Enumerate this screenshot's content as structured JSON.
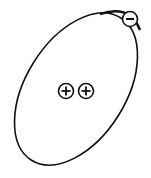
{
  "diagram": {
    "orbit": {
      "shape": "ellipse",
      "stroke": "#111111"
    },
    "nucleus": {
      "particles": [
        {
          "type": "proton",
          "symbol": "+"
        },
        {
          "type": "proton",
          "symbol": "+"
        }
      ]
    },
    "electrons": [
      {
        "type": "electron",
        "symbol": "−"
      }
    ],
    "colors": {
      "line": "#111111",
      "fill": "#ffffff"
    }
  }
}
